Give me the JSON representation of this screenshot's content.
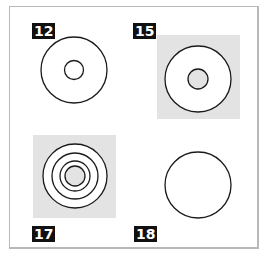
{
  "figure": {
    "panels": [
      {
        "label": "12",
        "background": "none",
        "rings": 2,
        "inner_fill": "none"
      },
      {
        "label": "15",
        "background": "#e3e3e3",
        "rings": 2,
        "inner_fill": "#e3e3e3"
      },
      {
        "label": "17",
        "background": "#e3e3e3",
        "rings": 4,
        "inner_fill": "#e3e3e3"
      },
      {
        "label": "18",
        "background": "none",
        "rings": 1,
        "inner_fill": "none"
      }
    ]
  },
  "colors": {
    "frame": "#b8b8b8",
    "label_bg": "#111111",
    "label_text": "#ffffff",
    "stroke": "#1a1a1a",
    "shade": "#e3e3e3"
  }
}
